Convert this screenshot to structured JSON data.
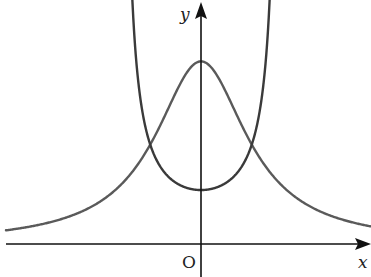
{
  "chart_data": {
    "type": "line",
    "title": "",
    "xlabel": "x",
    "ylabel": "y",
    "origin_label": "O",
    "xlim": [
      -2.0,
      2.35
    ],
    "ylim": [
      -0.35,
      3.0
    ],
    "grid": false,
    "legend": "none",
    "series": [
      {
        "name": "bell-curve",
        "description": "symmetric bell-shaped curve, maximum on the y-axis, tending to 0 as |x| grows",
        "formula": "y = 2.2 / (1 + 2.4 x^2)",
        "color": "#5a5a5a"
      },
      {
        "name": "u-curve",
        "description": "U-shaped curve with minimum on the y-axis and vertical asymptotes on either side",
        "formula": "y = 0.65 / cos(x * 1.5708 / 0.93)",
        "asymptotes_x": [
          -0.93,
          0.93
        ],
        "color": "#3a3a3a"
      }
    ],
    "intersections_approx": [
      [
        -0.77,
        1.1
      ],
      [
        0.77,
        1.1
      ]
    ],
    "colors": {
      "axes": "#111111",
      "labels": "#222222"
    }
  }
}
